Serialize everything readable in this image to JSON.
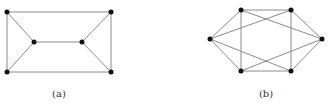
{
  "figures": [
    {
      "id": "a",
      "caption": "(a)",
      "caption_x": 39,
      "nodes": [
        {
          "name": "top-left",
          "x": 7,
          "y": 12
        },
        {
          "name": "top-right",
          "x": 111,
          "y": 12
        },
        {
          "name": "bottom-left",
          "x": 7,
          "y": 72
        },
        {
          "name": "bottom-right",
          "x": 111,
          "y": 72
        },
        {
          "name": "inner-left",
          "x": 34,
          "y": 42
        },
        {
          "name": "inner-right",
          "x": 82,
          "y": 42
        }
      ],
      "edges": [
        [
          0,
          1
        ],
        [
          2,
          3
        ],
        [
          0,
          2
        ],
        [
          1,
          3
        ],
        [
          0,
          4
        ],
        [
          2,
          4
        ],
        [
          1,
          5
        ],
        [
          3,
          5
        ],
        [
          4,
          5
        ]
      ]
    },
    {
      "id": "b",
      "caption": "(b)",
      "caption_x": 246,
      "nodes": [
        {
          "name": "left",
          "x": 210,
          "y": 39
        },
        {
          "name": "top-left",
          "x": 241,
          "y": 10
        },
        {
          "name": "top-right",
          "x": 291,
          "y": 10
        },
        {
          "name": "right",
          "x": 322,
          "y": 39
        },
        {
          "name": "bottom-left",
          "x": 241,
          "y": 71
        },
        {
          "name": "bottom-right",
          "x": 291,
          "y": 71
        }
      ],
      "edges": [
        [
          0,
          1
        ],
        [
          0,
          4
        ],
        [
          0,
          2
        ],
        [
          0,
          5
        ],
        [
          3,
          2
        ],
        [
          3,
          5
        ],
        [
          3,
          1
        ],
        [
          3,
          4
        ],
        [
          1,
          2
        ],
        [
          4,
          5
        ],
        [
          1,
          4
        ],
        [
          2,
          5
        ]
      ]
    }
  ],
  "style": {
    "edge_color": "#8a8a8a",
    "node_color": "#111111",
    "node_radius": 2.5
  }
}
